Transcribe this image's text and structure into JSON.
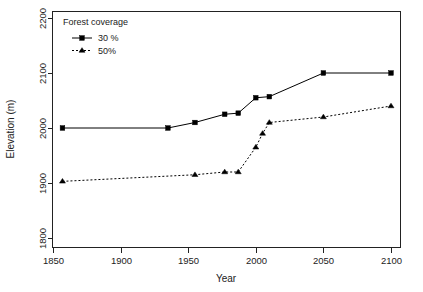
{
  "chart_data": {
    "type": "line",
    "title": "",
    "xlabel": "Year",
    "ylabel": "Elevation (m)",
    "xlim": [
      1845,
      2110
    ],
    "ylim": [
      1790,
      2212
    ],
    "xticks": [
      1850,
      1900,
      1950,
      2000,
      2050,
      2100
    ],
    "xticklabels": [
      "1850",
      "1900",
      "1950",
      "2000",
      "2050",
      "2100"
    ],
    "yticks": [
      1800,
      1900,
      2000,
      2100,
      2200
    ],
    "yticklabels": [
      "1800",
      "1900",
      "2000",
      "2100",
      "2200"
    ],
    "grid": false,
    "legend": {
      "title": "Forest coverage",
      "position": "top-left",
      "entries": [
        {
          "label": "30 %",
          "marker": "square",
          "line": "solid"
        },
        {
          "label": "50%",
          "marker": "triangle",
          "line": "dashed"
        }
      ]
    },
    "series": [
      {
        "name": "30 %",
        "marker": "square",
        "linestyle": "solid",
        "color": "#000000",
        "points": [
          {
            "x": 1857,
            "y": 2000
          },
          {
            "x": 1935,
            "y": 2000
          },
          {
            "x": 1955,
            "y": 2010
          },
          {
            "x": 1977,
            "y": 2025
          },
          {
            "x": 1987,
            "y": 2027
          },
          {
            "x": 2000,
            "y": 2055
          },
          {
            "x": 2010,
            "y": 2057
          },
          {
            "x": 2050,
            "y": 2100
          },
          {
            "x": 2100,
            "y": 2100
          }
        ]
      },
      {
        "name": "50%",
        "marker": "triangle",
        "linestyle": "dashed",
        "color": "#000000",
        "points": [
          {
            "x": 1857,
            "y": 1903
          },
          {
            "x": 1955,
            "y": 1915
          },
          {
            "x": 1977,
            "y": 1920
          },
          {
            "x": 1987,
            "y": 1920
          },
          {
            "x": 2000,
            "y": 1965
          },
          {
            "x": 2005,
            "y": 1990
          },
          {
            "x": 2010,
            "y": 2010
          },
          {
            "x": 2050,
            "y": 2020
          },
          {
            "x": 2100,
            "y": 2040
          }
        ]
      }
    ]
  },
  "figure": {
    "background": "#ffffff",
    "foreground": "#222222"
  }
}
